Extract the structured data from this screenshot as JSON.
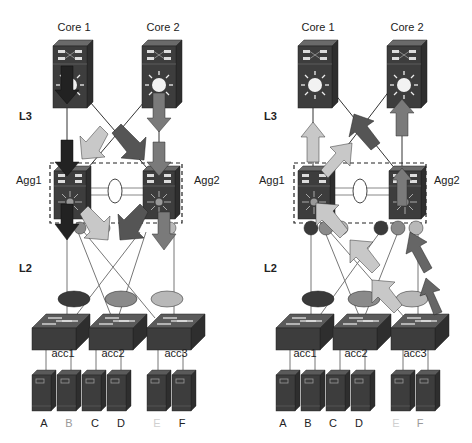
{
  "diagrams": [
    {
      "id": "left",
      "description": "Traffic flowing down from core to servers",
      "core_labels": [
        "Core 1",
        "Core 2"
      ],
      "layer_labels": {
        "l3": "L3",
        "l2": "L2"
      },
      "agg_labels": [
        "Agg1",
        "Agg2"
      ],
      "access_labels": [
        "acc1",
        "acc2",
        "acc3"
      ],
      "server_labels": [
        "A",
        "B",
        "C",
        "D",
        "E",
        "F"
      ],
      "server_label_colors": [
        "#222222",
        "#9a9a9a",
        "#222222",
        "#222222",
        "#d0d0d0",
        "#222222"
      ]
    },
    {
      "id": "right",
      "description": "Traffic flowing up from servers to core",
      "core_labels": [
        "Core 1",
        "Core 2"
      ],
      "layer_labels": {
        "l3": "L3",
        "l2": "L2"
      },
      "agg_labels": [
        "Agg1",
        "Agg2"
      ],
      "access_labels": [
        "acc1",
        "acc2",
        "acc3"
      ],
      "server_labels": [
        "A",
        "B",
        "C",
        "D",
        "E",
        "F"
      ],
      "server_label_colors": [
        "#222222",
        "#222222",
        "#222222",
        "#222222",
        "#d0d0d0",
        "#9a9a9a"
      ]
    }
  ],
  "colors": {
    "device_body": "#3d3d3d",
    "device_top": "#5a5a5a",
    "vlan_dark": "#3a3a3a",
    "vlan_mid": "#8a8a8a",
    "vlan_light": "#b8b8b8",
    "arrow_black": "#222222",
    "arrow_dark": "#555555",
    "arrow_mid": "#7a7a7a",
    "arrow_light": "#c8c8c8"
  }
}
